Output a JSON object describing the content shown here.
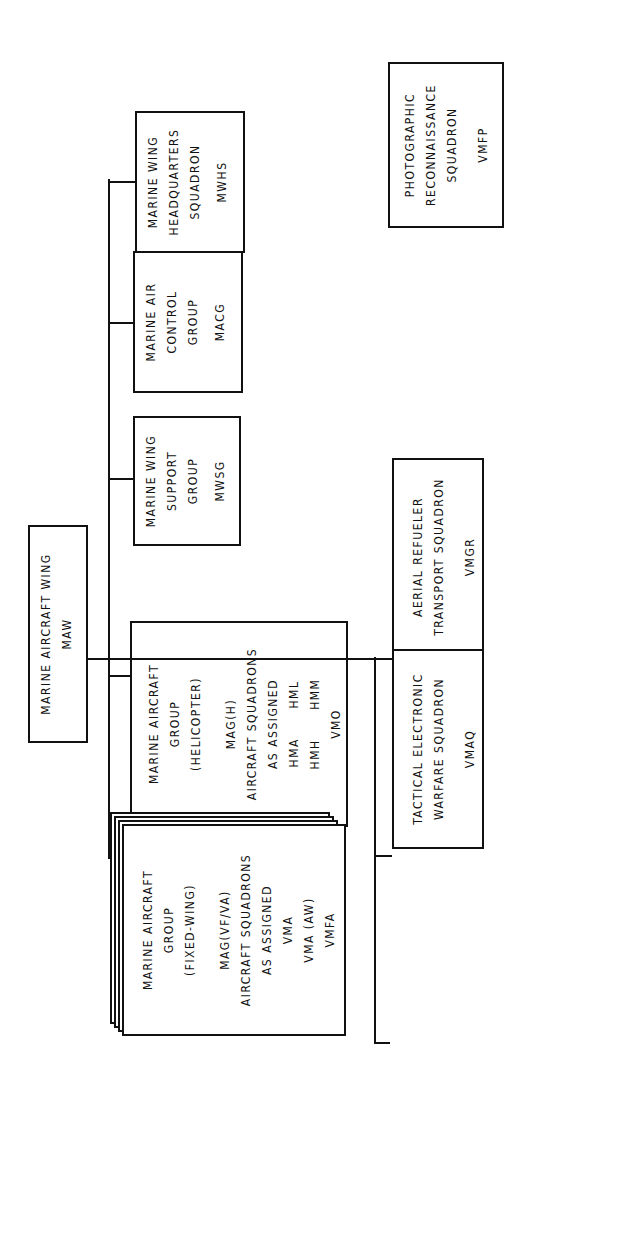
{
  "chart": {
    "root": {
      "lines": [
        "MARINE AIRCRAFT WING"
      ],
      "abbr": "MAW"
    },
    "groups": [
      {
        "lines": [
          "MARINE WING",
          "HEADQUARTERS",
          "SQUADRON"
        ],
        "abbr": "MWHS"
      },
      {
        "lines": [
          "MARINE AIR",
          "CONTROL",
          "GROUP"
        ],
        "abbr": "MACG"
      },
      {
        "lines": [
          "MARINE WING",
          "SUPPORT",
          "GROUP"
        ],
        "abbr": "MWSG"
      }
    ],
    "mag_helicopter": {
      "lines": [
        "MARINE AIRCRAFT",
        "GROUP",
        "(HELICOPTER)"
      ],
      "designation": "MAG(H)",
      "squadrons_heading": [
        "AIRCRAFT SQUADRONS",
        "AS ASSIGNED"
      ],
      "squadrons": [
        "HMA      HML",
        "HMH      HMM",
        "VMO"
      ]
    },
    "mag_fixed_wing": {
      "lines": [
        "MARINE AIRCRAFT",
        "GROUP",
        "(FIXED-WING)"
      ],
      "designation": "MAG(VF/VA)",
      "squadrons_heading": [
        "AIRCRAFT SQUADRONS",
        "AS ASSIGNED"
      ],
      "squadrons": [
        "VMA",
        "VMA (AW)",
        "VMFA"
      ]
    },
    "squadrons": [
      {
        "lines": [
          "AERIAL REFUELER",
          "TRANSPORT SQUADRON"
        ],
        "abbr": "VMGR"
      },
      {
        "lines": [
          "TACTICAL ELECTRONIC",
          "WARFARE SQUADRON"
        ],
        "abbr": "VMAQ"
      },
      {
        "lines": [
          "PHOTOGRAPHIC",
          "RECONNAISSANCE",
          "SQUADRON"
        ],
        "abbr": "VMFP"
      }
    ],
    "or_label": "or"
  },
  "notes": {
    "title": "NOTES",
    "items": [
      {
        "num": "1.",
        "lines": [
          "Wings are task oriented and the number of aircraft",
          "groups in each wing varies accordingly."
        ]
      },
      {
        "num": "2.",
        "lines": [
          "Aircraft groups are also task oriented and the",
          "number of aircraft squadrons in each MAG varies."
        ]
      },
      {
        "num": "3.",
        "lines": [
          "VMGR squadrons are capable of independent",
          "operations and may deploy independently of a",
          "group or wing."
        ]
      },
      {
        "num": "4.",
        "lines": [
          "There is one VMAQ and one VMFP squadron.  Each",
          "is based with one of the wings but provides",
          "detachments to the other two wings",
          "as required."
        ]
      }
    ]
  }
}
